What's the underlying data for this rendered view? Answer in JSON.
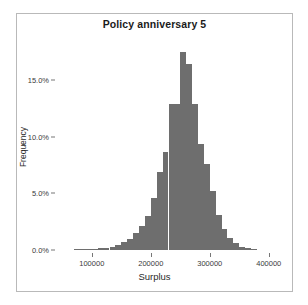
{
  "chart_data": {
    "type": "bar",
    "title": "Policy anniversary 5",
    "xlabel": "Surplus",
    "ylabel": "Frequency",
    "xlim": [
      41000,
      419000
    ],
    "ylim": [
      0,
      18.2
    ],
    "grid": false,
    "legend": null,
    "bin_width": 10000,
    "xticks": [
      100000,
      200000,
      300000,
      400000
    ],
    "xticklabels": [
      "100000",
      "200000",
      "300000",
      "400000"
    ],
    "yticks": [
      0,
      5,
      10,
      15
    ],
    "yticklabels": [
      "0.0%",
      "5.0%",
      "10.0%",
      "15.0%"
    ],
    "bar_color": "#6e6e6e",
    "x": [
      75000,
      85000,
      95000,
      105000,
      115000,
      125000,
      135000,
      145000,
      155000,
      165000,
      175000,
      185000,
      195000,
      205000,
      215000,
      225000,
      235000,
      245000,
      255000,
      265000,
      275000,
      285000,
      295000,
      305000,
      315000,
      325000,
      335000,
      345000,
      355000,
      365000,
      375000
    ],
    "values": [
      0.05,
      0.06,
      0.08,
      0.1,
      0.15,
      0.2,
      0.3,
      0.45,
      0.7,
      1.0,
      1.5,
      2.1,
      3.0,
      4.6,
      6.9,
      8.7,
      12.9,
      12.9,
      17.5,
      16.4,
      12.9,
      9.4,
      7.6,
      5.2,
      3.1,
      1.9,
      1.1,
      0.6,
      0.3,
      0.15,
      0.08
    ],
    "categories": [
      "75000",
      "85000",
      "95000",
      "105000",
      "115000",
      "125000",
      "135000",
      "145000",
      "155000",
      "165000",
      "175000",
      "185000",
      "195000",
      "205000",
      "215000",
      "225000",
      "235000",
      "245000",
      "255000",
      "265000",
      "275000",
      "285000",
      "295000",
      "305000",
      "315000",
      "325000",
      "335000",
      "345000",
      "355000",
      "365000",
      "375000"
    ]
  }
}
